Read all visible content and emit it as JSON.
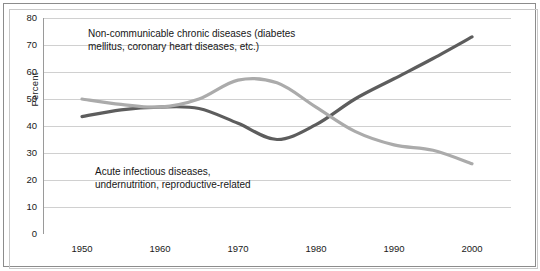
{
  "chart_data": {
    "type": "line",
    "title": "",
    "xlabel": "",
    "ylabel": "Percent",
    "xlim": [
      1945,
      2005
    ],
    "ylim": [
      0,
      80
    ],
    "ytick_step": 10,
    "grid": true,
    "legend_position": "none",
    "xticks": [
      "1950",
      "1960",
      "1970",
      "1980",
      "1990",
      "2000"
    ],
    "yticks": [
      "0",
      "10",
      "20",
      "30",
      "40",
      "50",
      "60",
      "70",
      "80"
    ],
    "annotations": [
      {
        "id": "chronic",
        "text": "Non-communicable chronic diseases (diabetes\nmellitus, coronary heart diseases, etc.)"
      },
      {
        "id": "acute",
        "text": "Acute infectious diseases,\nundernutrition, reproductive-related"
      }
    ],
    "x": [
      1950,
      1955,
      1960,
      1965,
      1970,
      1975,
      1980,
      1985,
      1990,
      1995,
      2000
    ],
    "series": [
      {
        "name": "Non-communicable chronic diseases (diabetes mellitus, coronary heart diseases, etc.)",
        "color": "#5d5d5d",
        "values": [
          43.5,
          46,
          47,
          46.5,
          41,
          35,
          40.5,
          50,
          57.5,
          65,
          73
        ]
      },
      {
        "name": "Acute infectious diseases, undernutrition, reproductive-related",
        "color": "#ababab",
        "values": [
          50,
          48,
          47,
          50,
          57,
          56,
          47,
          38,
          33,
          31,
          26
        ]
      }
    ]
  },
  "colors": {
    "chronic_line": "#5d5d5d",
    "acute_line": "#ababab",
    "gridline": "#d0d0d0",
    "axis": "#9a9a9a",
    "frame_outer": "#8c8c8c",
    "frame_inner": "#c9c9c9",
    "text": "#161616",
    "background": "#ffffff"
  }
}
